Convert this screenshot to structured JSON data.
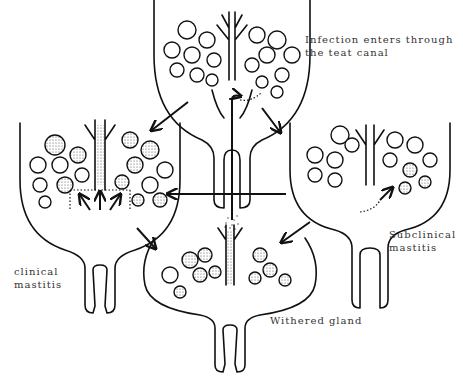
{
  "diagram": {
    "stages": [
      {
        "id": "infection",
        "label_lines": [
          "Infection enters through",
          "the teat canal"
        ]
      },
      {
        "id": "clinical",
        "label_lines": [
          "clinical",
          "mastitis"
        ]
      },
      {
        "id": "subclinical",
        "label_lines": [
          "Subclinical",
          "mastitis"
        ]
      },
      {
        "id": "withered",
        "label_lines": [
          "Withered gland"
        ]
      }
    ],
    "arrows": [
      {
        "from": "infection",
        "to": "clinical"
      },
      {
        "from": "infection",
        "to": "subclinical"
      },
      {
        "from": "subclinical",
        "to": "clinical"
      },
      {
        "from": "clinical",
        "to": "withered"
      },
      {
        "from": "subclinical",
        "to": "withered"
      }
    ],
    "colors": {
      "line": "#111111",
      "background": "#ffffff",
      "text": "#333333"
    }
  }
}
